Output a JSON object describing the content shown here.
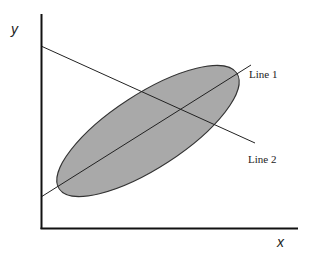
{
  "diagram": {
    "axes": {
      "x_label": "x",
      "y_label": "y"
    },
    "lines": [
      {
        "name": "line-1",
        "label": "Line 1"
      },
      {
        "name": "line-2",
        "label": "Line 2"
      }
    ],
    "ellipse": {
      "description": "shaded elliptical region oriented along Line 1",
      "fill_color": "#a9a9a9",
      "stroke_color": "#333333"
    },
    "colors": {
      "axis": "#111111",
      "line": "#222222",
      "background": "#ffffff"
    }
  }
}
